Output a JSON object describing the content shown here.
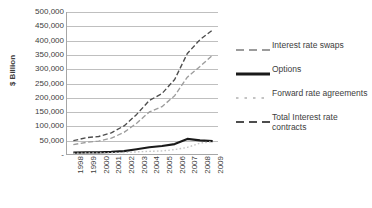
{
  "chart_data": {
    "type": "line",
    "title": "",
    "xlabel": "",
    "ylabel": "$ Billion",
    "x": [
      "1998",
      "1999",
      "2000",
      "2001",
      "2002",
      "2003",
      "2004",
      "2005",
      "2006",
      "2007",
      "2008",
      "2009"
    ],
    "ylim": [
      0,
      500000
    ],
    "ytick_labels": [
      "500,000",
      "450,000",
      "400,000",
      "350,000",
      "300,000",
      "250,000",
      "200,000",
      "150,000",
      "100,000",
      "50,000",
      "-"
    ],
    "ytick_values": [
      500000,
      450000,
      400000,
      350000,
      300000,
      250000,
      200000,
      150000,
      100000,
      50000,
      0
    ],
    "grid": true,
    "legend_position": "right",
    "series": [
      {
        "name": "Interest rate swaps",
        "style": "dashed",
        "color": "#9c9c9c",
        "values": [
          36262,
          43936,
          48768,
          58897,
          79120,
          111209,
          150631,
          169106,
          207323,
          272216,
          309588,
          349288
        ]
      },
      {
        "name": "Options",
        "style": "solid",
        "color": "#1a1a1a",
        "values": [
          7997,
          9380,
          9476,
          10933,
          13746,
          20012,
          27082,
          31588,
          38169,
          56238,
          51301,
          48808
        ]
      },
      {
        "name": "Forward rate agreements",
        "style": "dotted",
        "color": "#c4c4c4",
        "values": [
          5756,
          7137,
          6771,
          7737,
          8792,
          10769,
          12788,
          14269,
          18668,
          26599,
          41561,
          46798
        ]
      },
      {
        "name": "Total Interest rate contracts",
        "style": "dashed",
        "color": "#4d4d4d",
        "values": [
          50015,
          60453,
          64668,
          77568,
          101658,
          141991,
          190502,
          214963,
          264160,
          355033,
          403290,
          437228
        ]
      }
    ]
  },
  "legend": {
    "items": [
      {
        "label": "Interest rate swaps"
      },
      {
        "label": "Options"
      },
      {
        "label": "Forward rate agreements"
      },
      {
        "label": "Total Interest rate contracts"
      }
    ]
  }
}
